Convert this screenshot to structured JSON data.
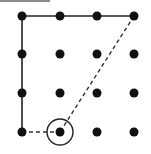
{
  "diagram": {
    "type": "dot-grid-path",
    "grid": {
      "rows": 4,
      "cols": 4,
      "x_positions": [
        22,
        60,
        97,
        134
      ],
      "y_positions": [
        16,
        54,
        93,
        132
      ],
      "dot_radius": 4.5,
      "dot_color": "#111111"
    },
    "solid_path": {
      "description": "Solid line from bottom-left up the left column, then across the top row to top-right",
      "points": [
        [
          0,
          3
        ],
        [
          0,
          0
        ],
        [
          3,
          0
        ]
      ],
      "color": "#222222",
      "width": 1.6
    },
    "dashed_segments": [
      {
        "from": [
          0,
          3
        ],
        "to": [
          1,
          3
        ],
        "color": "#333333",
        "width": 1.4,
        "dash": "4,3"
      },
      {
        "from": [
          3,
          0
        ],
        "to": [
          1,
          3
        ],
        "color": "#333333",
        "width": 1.4,
        "dash": "4,3"
      }
    ],
    "highlight": {
      "description": "Circled dot (start/end point)",
      "cell": [
        1,
        3
      ],
      "radius": 13,
      "color": "#222222",
      "width": 1.4
    },
    "top_edge_line": {
      "color": "#8a8a8a",
      "length": 50
    }
  }
}
